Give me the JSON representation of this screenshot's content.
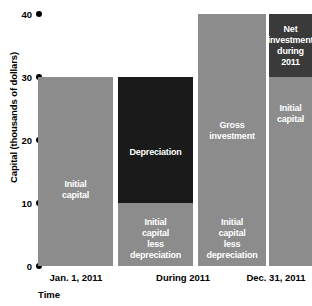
{
  "chart_data": {
    "type": "bar",
    "title": "",
    "xlabel": "Time",
    "ylabel": "Capital (thousands of dollars)",
    "ylim": [
      0,
      40
    ],
    "yticks": [
      0,
      10,
      20,
      30,
      40
    ],
    "ytick_labels": [
      "0",
      "10",
      "20",
      "30",
      "40"
    ],
    "grid": false,
    "legend": "none",
    "categories": [
      "Jan. 1, 2011",
      "During 2011",
      "Dec. 31, 2011"
    ],
    "bars": [
      {
        "name": "initial-capital-bar",
        "category": "Jan. 1, 2011",
        "total": 30,
        "segments": [
          {
            "name": "initial-capital",
            "label": "Initial\ncapital",
            "from": 0,
            "to": 30,
            "color": "#8c8c8c"
          }
        ]
      },
      {
        "name": "depreciation-bar",
        "category": "During 2011",
        "total": 30,
        "segments": [
          {
            "name": "depreciation",
            "label": "Depreciation",
            "from": 10,
            "to": 30,
            "color": "#1a1a1a"
          },
          {
            "name": "initial-capital-less-depreciation",
            "label": "Initial\ncapital\nless\ndepreciation",
            "from": 0,
            "to": 10,
            "color": "#8c8c8c"
          }
        ]
      },
      {
        "name": "gross-investment-bar",
        "category": "During 2011",
        "total": 40,
        "segments": [
          {
            "name": "gross-investment",
            "label": "Gross\ninvestment",
            "from": 10,
            "to": 40,
            "color": "#8c8c8c"
          },
          {
            "name": "initial-capital-less-depreciation",
            "label": "Initial\ncapital\nless\ndepreciation",
            "from": 0,
            "to": 10,
            "color": "#8c8c8c"
          }
        ]
      },
      {
        "name": "net-investment-bar",
        "category": "Dec. 31, 2011",
        "total": 40,
        "segments": [
          {
            "name": "net-investment-during-2011",
            "label": "Net\ninvestment\nduring 2011",
            "from": 30,
            "to": 40,
            "color": "#3a3a3a"
          },
          {
            "name": "initial-capital",
            "label": "Initial\ncapital",
            "from": 0,
            "to": 30,
            "color": "#8c8c8c"
          }
        ]
      }
    ],
    "colors": {
      "bar_gray": "#8c8c8c",
      "bar_black": "#1a1a1a",
      "bar_dark_gray": "#3a3a3a",
      "background": "#ffffff",
      "text": "#000000",
      "segment_text": "#ffffff"
    }
  },
  "axis": {
    "y_title": "Capital (thousands of dollars)",
    "x_title": "Time",
    "ticks": [
      {
        "value": 40,
        "label": "40"
      },
      {
        "value": 30,
        "label": "30"
      },
      {
        "value": 20,
        "label": "20"
      },
      {
        "value": 10,
        "label": "10"
      },
      {
        "value": 0,
        "label": "0"
      }
    ]
  },
  "x_labels": [
    {
      "name": "jan-1-2011",
      "label": "Jan. 1, 2011"
    },
    {
      "name": "during-2011",
      "label": "During 2011"
    },
    {
      "name": "dec-31-2011",
      "label": "Dec. 31, 2011"
    }
  ]
}
